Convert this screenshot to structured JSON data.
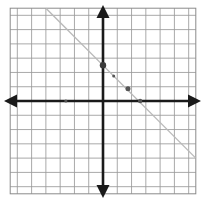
{
  "figure": {
    "kind": "coordinate-plane-graph",
    "background_color": "#ffffff",
    "grid_color": "#9a9a9a",
    "grid_border_color": "#8a8a8a",
    "axis_color": "#1a1a1a",
    "line_color": "#b9b9b9",
    "point_color": "#555555",
    "point_color_dark": "#3a3a3a"
  },
  "chart_data": {
    "type": "scatter",
    "title": "",
    "xlabel": "",
    "ylabel": "",
    "grid": true,
    "legend": null,
    "xlim": [
      -6.5,
      6.5
    ],
    "ylim": [
      -6.5,
      6.5
    ],
    "xticks": [
      -6,
      -5,
      -4,
      -3,
      -2,
      -1,
      0,
      1,
      2,
      3,
      4,
      5,
      6
    ],
    "yticks": [
      -6,
      -5,
      -4,
      -3,
      -2,
      -1,
      0,
      1,
      2,
      3,
      4,
      5,
      6
    ],
    "xtick_labels": [],
    "ytick_labels": [],
    "axes": {
      "x_axis_arrows": "both",
      "y_axis_arrows": "both",
      "x_axis_y_value": 0,
      "y_axis_x_value": 0
    },
    "series": [
      {
        "name": "trend-line",
        "type": "line",
        "style": "solid-faint",
        "slope": -1,
        "intercept": 2.5,
        "x": [
          -6.5,
          6.5
        ],
        "y": [
          9.0,
          -4.0
        ]
      },
      {
        "name": "plotted-points",
        "type": "scatter",
        "x": [
          -2.6,
          0,
          0.75,
          1.75,
          2.6
        ],
        "y": [
          0,
          2.5,
          1.75,
          0.85,
          0
        ],
        "sizes": [
          3.2,
          6.4,
          3.0,
          5.0,
          4.4
        ]
      }
    ],
    "points": [
      {
        "label": "point-on-negative-x-axis",
        "x": -2.6,
        "y": 0,
        "radius": 1.6
      },
      {
        "label": "point-y-intercept",
        "x": 0,
        "y": 2.5,
        "radius": 3.2
      },
      {
        "label": "point-small-upper",
        "x": 0.75,
        "y": 1.75,
        "radius": 1.5
      },
      {
        "label": "point-mid",
        "x": 1.75,
        "y": 0.85,
        "radius": 2.5
      },
      {
        "label": "point-x-intercept",
        "x": 2.6,
        "y": 0,
        "radius": 2.2
      }
    ]
  }
}
